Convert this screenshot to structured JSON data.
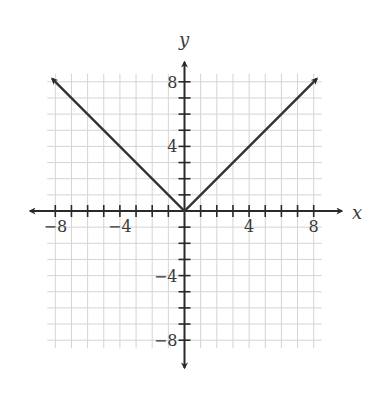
{
  "chart_data": {
    "type": "line",
    "title": "",
    "xlabel": "x",
    "ylabel": "y",
    "xlim": [
      -8.5,
      8.5
    ],
    "ylim": [
      -8.5,
      8.5
    ],
    "grid": true,
    "grid_step": 1,
    "x_ticks": [
      -8,
      -4,
      4,
      8
    ],
    "y_ticks": [
      8,
      4,
      -4,
      -8
    ],
    "x_tick_labels": [
      "−8",
      "−4",
      "4",
      "8"
    ],
    "y_tick_labels": [
      "8",
      "4",
      "−4",
      "−8"
    ],
    "series": [
      {
        "name": "y = |x|",
        "points": [
          [
            -8.2,
            8.2
          ],
          [
            0,
            0
          ],
          [
            8.2,
            8.2
          ]
        ],
        "arrows_at_ends": true
      }
    ],
    "colors": {
      "curve": "#333333",
      "axes": "#2a2a2a",
      "grid": "#d4d4d4"
    }
  }
}
